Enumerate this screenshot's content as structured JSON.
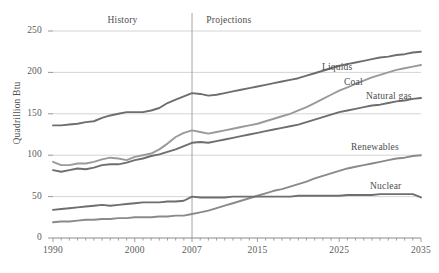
{
  "chart_data": {
    "type": "line",
    "title": "",
    "xlabel": "",
    "ylabel": "Quadrillion Btu",
    "xlim": [
      1990,
      2035
    ],
    "ylim": [
      0,
      250
    ],
    "ytick_labels": [
      "0",
      "50",
      "100",
      "150",
      "200",
      "250"
    ],
    "ytick_values": [
      0,
      50,
      100,
      150,
      200,
      250
    ],
    "xtick_labels": [
      "1990",
      "2000",
      "2007",
      "2015",
      "2025",
      "2035"
    ],
    "xtick_values": [
      1990,
      2000,
      2007,
      2015,
      2025,
      2035
    ],
    "grid": "horizontal",
    "legend_position": "inline-series-labels",
    "annotations": [
      {
        "text": "History",
        "x": 1998.5
      },
      {
        "text": "Projections",
        "x": 2011.5
      }
    ],
    "divider_year": 2007,
    "x": [
      1990,
      1991,
      1992,
      1993,
      1994,
      1995,
      1996,
      1997,
      1998,
      1999,
      2000,
      2001,
      2002,
      2003,
      2004,
      2005,
      2006,
      2007,
      2008,
      2009,
      2010,
      2011,
      2012,
      2013,
      2014,
      2015,
      2016,
      2017,
      2018,
      2019,
      2020,
      2021,
      2022,
      2023,
      2024,
      2025,
      2026,
      2027,
      2028,
      2029,
      2030,
      2031,
      2032,
      2033,
      2034,
      2035
    ],
    "series": [
      {
        "name": "Liquids",
        "color": "#6e6e6e",
        "values": [
          136,
          136,
          137,
          138,
          140,
          141,
          145,
          148,
          150,
          152,
          152,
          152,
          154,
          157,
          163,
          167,
          171,
          175,
          174,
          172,
          173,
          175,
          177,
          179,
          181,
          183,
          185,
          187,
          189,
          191,
          193,
          196,
          199,
          202,
          205,
          208,
          210,
          212,
          214,
          216,
          218,
          219,
          221,
          222,
          224,
          225
        ]
      },
      {
        "name": "Coal",
        "color": "#9a9a9a",
        "values": [
          92,
          88,
          88,
          90,
          90,
          92,
          95,
          97,
          96,
          94,
          98,
          100,
          102,
          107,
          114,
          122,
          127,
          130,
          128,
          126,
          128,
          130,
          132,
          134,
          136,
          138,
          141,
          144,
          147,
          150,
          154,
          158,
          163,
          168,
          173,
          178,
          182,
          186,
          190,
          194,
          197,
          200,
          203,
          205,
          207,
          209
        ]
      },
      {
        "name": "Natural gas",
        "color": "#6e6e6e",
        "values": [
          82,
          80,
          82,
          84,
          83,
          85,
          88,
          89,
          89,
          91,
          94,
          96,
          99,
          101,
          104,
          107,
          111,
          115,
          116,
          115,
          117,
          119,
          121,
          123,
          125,
          127,
          129,
          131,
          133,
          135,
          137,
          140,
          143,
          146,
          149,
          152,
          154,
          156,
          158,
          160,
          161,
          163,
          165,
          166,
          168,
          169
        ]
      },
      {
        "name": "Renewables",
        "color": "#8a8a8a",
        "values": [
          19,
          20,
          20,
          21,
          22,
          22,
          23,
          23,
          24,
          24,
          25,
          25,
          25,
          26,
          26,
          27,
          27,
          29,
          31,
          33,
          36,
          39,
          42,
          45,
          48,
          51,
          54,
          57,
          59,
          62,
          65,
          68,
          72,
          75,
          78,
          81,
          84,
          86,
          88,
          90,
          92,
          94,
          96,
          97,
          99,
          100
        ]
      },
      {
        "name": "Nuclear",
        "color": "#6e6e6e",
        "values": [
          34,
          35,
          36,
          37,
          38,
          39,
          40,
          39,
          40,
          41,
          42,
          43,
          43,
          43,
          44,
          44,
          45,
          50,
          49,
          49,
          49,
          49,
          50,
          50,
          50,
          50,
          50,
          50,
          50,
          50,
          51,
          51,
          51,
          51,
          51,
          51,
          52,
          52,
          52,
          52,
          53,
          53,
          53,
          53,
          53,
          49
        ]
      }
    ],
    "series_label_positions": [
      {
        "name": "Liquids",
        "left": 322,
        "top": 62
      },
      {
        "name": "Coal",
        "left": 344,
        "top": 77
      },
      {
        "name": "Natural gas",
        "left": 366,
        "top": 91
      },
      {
        "name": "Renewables",
        "left": 351,
        "top": 142
      },
      {
        "name": "Nuclear",
        "left": 370,
        "top": 181
      }
    ]
  },
  "colors": {
    "background": "#ffffff",
    "grid": "#c9c9c9",
    "axis": "#8a8a8a",
    "text": "#4d4d4d",
    "divider": "#9a9a9a"
  }
}
